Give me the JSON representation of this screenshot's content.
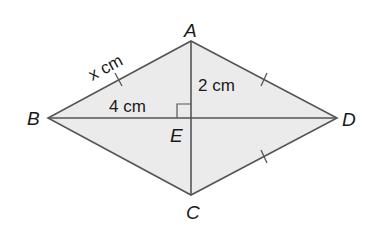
{
  "diagram": {
    "type": "rhombus-kite",
    "fill_color": "#ebebeb",
    "stroke_color": "#555555",
    "vertices": {
      "A": {
        "label": "A",
        "x": 191,
        "y": 41
      },
      "B": {
        "label": "B",
        "x": 48,
        "y": 118
      },
      "C": {
        "label": "C",
        "x": 191,
        "y": 195
      },
      "D": {
        "label": "D",
        "x": 337,
        "y": 118
      },
      "E": {
        "label": "E",
        "x": 191,
        "y": 118
      }
    },
    "labels": {
      "A": "A",
      "B": "B",
      "C": "C",
      "D": "D",
      "E": "E",
      "side_AB": "x cm",
      "BE": "4 cm",
      "AE": "2 cm"
    },
    "annotations": {
      "right_angle_at": "E",
      "equal_side_ticks": [
        "AB",
        "AD",
        "CD"
      ]
    }
  }
}
